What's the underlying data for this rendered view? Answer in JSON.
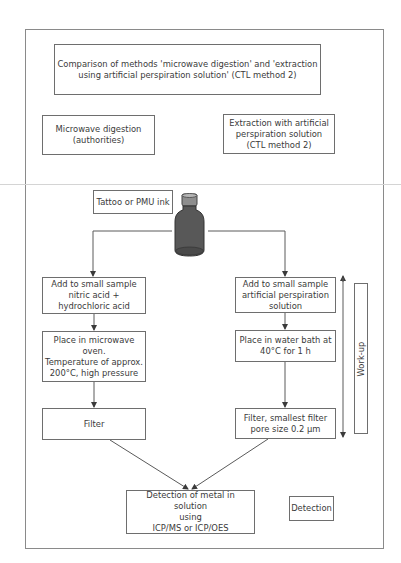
{
  "diagram": {
    "title": "Comparison of methods 'microwave digestion' and 'extraction\nusing artificial perspiration solution' (CTL method 2)",
    "methods": {
      "left": "Microwave digestion\n(authorities)",
      "right": "Extraction with artificial\nperspiration solution\n(CTL method 2)"
    },
    "sample": {
      "label": "Tattoo or PMU ink",
      "icon": "ink-bottle-icon"
    },
    "left_steps": [
      "Add to small sample\nnitric acid +\nhydrochloric acid",
      "Place in microwave\noven.\nTemperature of approx.\n200°C, high pressure",
      "Filter"
    ],
    "right_steps": [
      "Add to small sample\nartificial perspiration\nsolution",
      "Place in water bath at\n40°C for 1 h",
      "Filter, smallest filter\npore size 0.2 µm"
    ],
    "phase_workup": "Work-up",
    "detection_step": "Detection of metal in solution\nusing\nICP/MS or ICP/OES",
    "phase_detection": "Detection",
    "colors": {
      "line": "#5a5a5a",
      "bottle": "#585858",
      "border": "#6e6e6e"
    }
  }
}
